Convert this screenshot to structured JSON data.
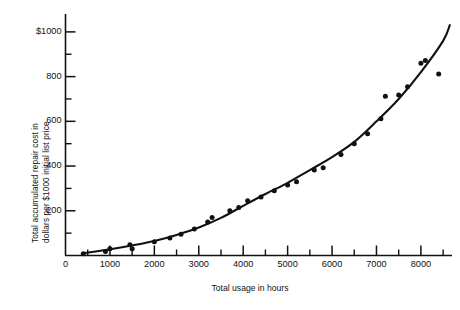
{
  "chart_data": {
    "type": "scatter",
    "title": "",
    "subtitle": "",
    "xlabel": "Total usage in hours",
    "ylabel": "Total accumulated repair cost in dollars per $1000 initial list price",
    "ylabel_line1": "Total accumulated repair cost in",
    "ylabel_line2": "dollars per $1000 initial list price",
    "xlim": [
      0,
      8700
    ],
    "ylim": [
      0,
      1080
    ],
    "grid": false,
    "legend": null,
    "legend_position": "none",
    "x_ticks": [
      0,
      1000,
      2000,
      3000,
      4000,
      5000,
      6000,
      7000,
      8000
    ],
    "x_tick_labels": [
      "0",
      "1000",
      "2000",
      "3000",
      "4000",
      "5000",
      "6000",
      "7000",
      "8000"
    ],
    "x_minor_ticks": [
      500,
      1500,
      2500,
      3500,
      4500,
      5500,
      6500,
      7500,
      8500
    ],
    "y_ticks": [
      200,
      400,
      600,
      800,
      1000
    ],
    "y_tick_labels": [
      "200",
      "400",
      "600",
      "800",
      "$1000"
    ],
    "y_minor_ticks": [
      100,
      300,
      500,
      700,
      900
    ],
    "marker": "filled-circle",
    "marker_color": "#111111",
    "line_color": "#111111",
    "points": [
      {
        "x": 400,
        "y": 8
      },
      {
        "x": 900,
        "y": 18
      },
      {
        "x": 1000,
        "y": 30
      },
      {
        "x": 1450,
        "y": 48
      },
      {
        "x": 1500,
        "y": 30
      },
      {
        "x": 2000,
        "y": 62
      },
      {
        "x": 2350,
        "y": 78
      },
      {
        "x": 2600,
        "y": 95
      },
      {
        "x": 2900,
        "y": 118
      },
      {
        "x": 3200,
        "y": 150
      },
      {
        "x": 3300,
        "y": 170
      },
      {
        "x": 3700,
        "y": 200
      },
      {
        "x": 3900,
        "y": 215
      },
      {
        "x": 4100,
        "y": 245
      },
      {
        "x": 4400,
        "y": 262
      },
      {
        "x": 4700,
        "y": 290
      },
      {
        "x": 5000,
        "y": 315
      },
      {
        "x": 5200,
        "y": 330
      },
      {
        "x": 5600,
        "y": 382
      },
      {
        "x": 5800,
        "y": 392
      },
      {
        "x": 6200,
        "y": 452
      },
      {
        "x": 6500,
        "y": 500
      },
      {
        "x": 6800,
        "y": 545
      },
      {
        "x": 7100,
        "y": 612
      },
      {
        "x": 7200,
        "y": 712
      },
      {
        "x": 7500,
        "y": 718
      },
      {
        "x": 7700,
        "y": 755
      },
      {
        "x": 8000,
        "y": 860
      },
      {
        "x": 8100,
        "y": 872
      },
      {
        "x": 8400,
        "y": 812
      }
    ],
    "fit_curve": {
      "description": "smooth increasing quadratic-like fitted curve through the scatter",
      "points": [
        {
          "x": 400,
          "y": 10
        },
        {
          "x": 1000,
          "y": 28
        },
        {
          "x": 1500,
          "y": 45
        },
        {
          "x": 2000,
          "y": 65
        },
        {
          "x": 2500,
          "y": 92
        },
        {
          "x": 3000,
          "y": 125
        },
        {
          "x": 3500,
          "y": 168
        },
        {
          "x": 4000,
          "y": 222
        },
        {
          "x": 4500,
          "y": 275
        },
        {
          "x": 5000,
          "y": 325
        },
        {
          "x": 5500,
          "y": 382
        },
        {
          "x": 6000,
          "y": 440
        },
        {
          "x": 6500,
          "y": 508
        },
        {
          "x": 7000,
          "y": 600
        },
        {
          "x": 7500,
          "y": 700
        },
        {
          "x": 8000,
          "y": 820
        },
        {
          "x": 8500,
          "y": 960
        },
        {
          "x": 8650,
          "y": 1030
        }
      ]
    }
  },
  "colors": {
    "background": "#ffffff",
    "ink": "#111111",
    "axis": "#111111"
  }
}
